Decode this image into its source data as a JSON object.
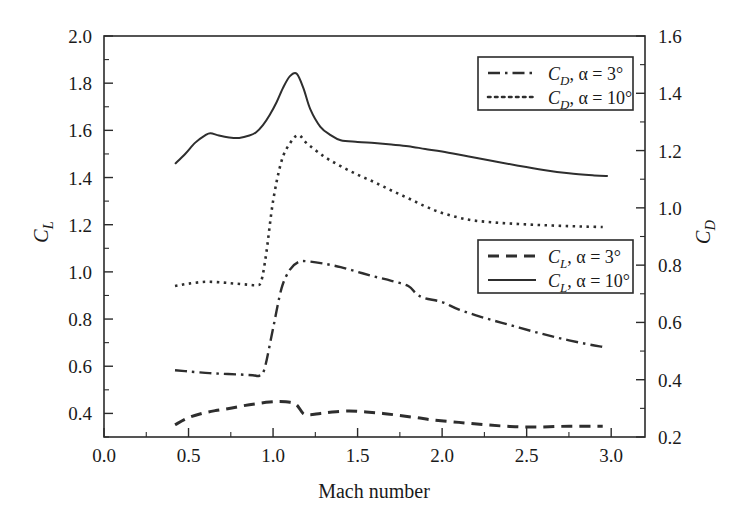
{
  "chart_data": {
    "type": "line",
    "title": "",
    "xlabel": "Mach number",
    "ylabel_left": "C_L",
    "ylabel_right": "C_D",
    "xlim": [
      0.0,
      3.2
    ],
    "ylim_left": [
      0.3,
      2.0
    ],
    "ylim_right": [
      0.2,
      1.6
    ],
    "grid": false,
    "xticks": [
      0.0,
      0.5,
      1.0,
      1.5,
      2.0,
      2.5,
      3.0
    ],
    "xtick_labels": [
      "0.0",
      "0.5",
      "1.0",
      "1.5",
      "2.0",
      "2.5",
      "3.0"
    ],
    "yticks_left": [
      0.4,
      0.6,
      0.8,
      1.0,
      1.2,
      1.4,
      1.6,
      1.8,
      2.0
    ],
    "ytick_labels_left": [
      "0.4",
      "0.6",
      "0.8",
      "1.0",
      "1.2",
      "1.4",
      "1.6",
      "1.8",
      "2.0"
    ],
    "yticks_right": [
      0.2,
      0.4,
      0.6,
      0.8,
      1.0,
      1.2,
      1.4,
      1.6
    ],
    "ytick_labels_right": [
      "0.2",
      "0.4",
      "0.6",
      "0.8",
      "1.0",
      "1.2",
      "1.4",
      "1.6"
    ],
    "series": [
      {
        "name": "CD_alpha_3",
        "legend": "C_D, α = 3°",
        "axis": "right",
        "style": "dashdot",
        "color": "#2e2e2e",
        "x": [
          0.42,
          0.5,
          0.6,
          0.7,
          0.8,
          0.88,
          0.92,
          0.95,
          1.0,
          1.05,
          1.1,
          1.15,
          1.2,
          1.3,
          1.4,
          1.5,
          1.6,
          1.7,
          1.8,
          1.85,
          1.9,
          2.0,
          2.1,
          2.25,
          2.4,
          2.55,
          2.7,
          2.85,
          2.95
        ],
        "y_left": [
          0.583,
          0.578,
          0.572,
          0.568,
          0.565,
          0.562,
          0.56,
          0.59,
          0.76,
          0.93,
          1.01,
          1.042,
          1.045,
          1.035,
          1.02,
          1.0,
          0.98,
          0.962,
          0.94,
          0.905,
          0.888,
          0.872,
          0.84,
          0.805,
          0.775,
          0.745,
          0.718,
          0.695,
          0.682
        ],
        "y_right": [
          0.449,
          0.445,
          0.44,
          0.437,
          0.434,
          0.432,
          0.43,
          0.456,
          0.596,
          0.736,
          0.802,
          0.829,
          0.831,
          0.823,
          0.811,
          0.794,
          0.778,
          0.763,
          0.745,
          0.716,
          0.702,
          0.689,
          0.662,
          0.633,
          0.608,
          0.583,
          0.561,
          0.542,
          0.531
        ]
      },
      {
        "name": "CD_alpha_10",
        "legend": "C_D, α = 10°",
        "axis": "right",
        "style": "dotted",
        "color": "#2e2e2e",
        "x": [
          0.42,
          0.5,
          0.6,
          0.7,
          0.78,
          0.85,
          0.9,
          0.93,
          0.96,
          1.0,
          1.05,
          1.1,
          1.15,
          1.2,
          1.3,
          1.4,
          1.5,
          1.6,
          1.7,
          1.8,
          1.9,
          2.0,
          2.15,
          2.3,
          2.45,
          2.6,
          2.75,
          2.85,
          2.95
        ],
        "y_left": [
          0.94,
          0.95,
          0.958,
          0.955,
          0.95,
          0.946,
          0.944,
          0.96,
          1.08,
          1.3,
          1.47,
          1.545,
          1.58,
          1.545,
          1.49,
          1.448,
          1.412,
          1.38,
          1.345,
          1.312,
          1.278,
          1.25,
          1.222,
          1.21,
          1.203,
          1.198,
          1.194,
          1.192,
          1.19
        ],
        "y_right": [
          0.743,
          0.751,
          0.758,
          0.755,
          0.751,
          0.748,
          0.746,
          0.759,
          0.858,
          1.04,
          1.18,
          1.242,
          1.271,
          1.242,
          1.197,
          1.163,
          1.133,
          1.106,
          1.078,
          1.05,
          1.022,
          0.999,
          0.976,
          0.966,
          0.961,
          0.956,
          0.953,
          0.952,
          0.95
        ]
      },
      {
        "name": "CL_alpha_3",
        "legend": "C_L, α = 3°",
        "axis": "left",
        "style": "dashed",
        "color": "#2e2e2e",
        "x": [
          0.42,
          0.5,
          0.58,
          0.66,
          0.74,
          0.82,
          0.9,
          0.98,
          1.04,
          1.1,
          1.14,
          1.18,
          1.22,
          1.28,
          1.35,
          1.45,
          1.55,
          1.65,
          1.75,
          1.85,
          1.95,
          2.1,
          2.25,
          2.4,
          2.55,
          2.7,
          2.85,
          2.95
        ],
        "y_left": [
          0.352,
          0.382,
          0.4,
          0.412,
          0.421,
          0.432,
          0.441,
          0.448,
          0.45,
          0.447,
          0.436,
          0.398,
          0.394,
          0.4,
          0.406,
          0.41,
          0.406,
          0.4,
          0.391,
          0.382,
          0.372,
          0.362,
          0.352,
          0.345,
          0.342,
          0.345,
          0.346,
          0.346
        ],
        "y_right": [
          0.243,
          0.268,
          0.282,
          0.293,
          0.3,
          0.309,
          0.317,
          0.323,
          0.324,
          0.321,
          0.312,
          0.281,
          0.277,
          0.282,
          0.287,
          0.29,
          0.287,
          0.282,
          0.274,
          0.267,
          0.259,
          0.25,
          0.243,
          0.237,
          0.235,
          0.237,
          0.238,
          0.238
        ]
      },
      {
        "name": "CL_alpha_10",
        "legend": "C_L, α = 10°",
        "axis": "left",
        "style": "solid",
        "color": "#2e2e2e",
        "x": [
          0.42,
          0.48,
          0.54,
          0.6,
          0.63,
          0.68,
          0.74,
          0.8,
          0.86,
          0.9,
          0.94,
          0.98,
          1.02,
          1.06,
          1.1,
          1.14,
          1.18,
          1.22,
          1.28,
          1.34,
          1.4,
          1.5,
          1.6,
          1.7,
          1.8,
          1.9,
          2.0,
          2.15,
          2.3,
          2.45,
          2.6,
          2.75,
          2.9,
          2.98
        ],
        "y_left": [
          1.458,
          1.5,
          1.548,
          1.58,
          1.588,
          1.578,
          1.57,
          1.568,
          1.578,
          1.592,
          1.622,
          1.665,
          1.718,
          1.782,
          1.83,
          1.84,
          1.778,
          1.69,
          1.615,
          1.58,
          1.558,
          1.551,
          1.546,
          1.54,
          1.533,
          1.521,
          1.51,
          1.49,
          1.47,
          1.45,
          1.432,
          1.418,
          1.409,
          1.406
        ],
        "y_right": [
          1.161,
          1.196,
          1.235,
          1.261,
          1.268,
          1.26,
          1.253,
          1.252,
          1.26,
          1.271,
          1.296,
          1.331,
          1.375,
          1.428,
          1.468,
          1.476,
          1.425,
          1.352,
          1.29,
          1.261,
          1.243,
          1.237,
          1.233,
          1.228,
          1.223,
          1.213,
          1.204,
          1.187,
          1.171,
          1.154,
          1.139,
          1.128,
          1.12,
          1.118
        ]
      }
    ],
    "legends": [
      {
        "name": "legend-drag",
        "entries": [
          {
            "symbol": "C",
            "subscript": "D",
            "condition": "α = 3°",
            "style": "dashdot"
          },
          {
            "symbol": "C",
            "subscript": "D",
            "condition": "α = 10°",
            "style": "dotted"
          }
        ]
      },
      {
        "name": "legend-lift",
        "entries": [
          {
            "symbol": "C",
            "subscript": "L",
            "condition": "α = 3°",
            "style": "dashed"
          },
          {
            "symbol": "C",
            "subscript": "L",
            "condition": "α = 10°",
            "style": "solid"
          }
        ]
      }
    ],
    "colors": {
      "curve": "#2e2e2e",
      "axis": "#2b2b2b",
      "background": "#ffffff",
      "text": "#1a1a1a"
    }
  }
}
